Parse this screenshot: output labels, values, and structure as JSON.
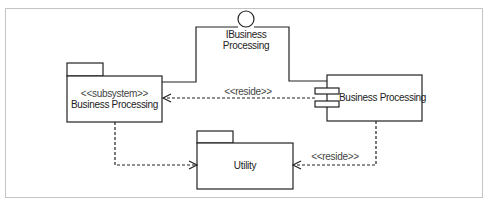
{
  "diagram": {
    "type": "UML component/subsystem diagram",
    "colors": {
      "line": "#222222",
      "frame": "#c4c4c4",
      "background": "#ffffff"
    },
    "interface": {
      "name_line1": "IBusiness",
      "name_line2": "Processing",
      "icon": "lollipop-interface-icon"
    },
    "subsystem": {
      "stereotype": "<<subsystem>>",
      "name": "Business Processing",
      "icon": "package-icon"
    },
    "component": {
      "name": "Business Processing",
      "icon": "component-icon"
    },
    "utility": {
      "name": "Utility",
      "icon": "package-icon"
    },
    "relations": [
      {
        "from": "component",
        "to": "subsystem",
        "label": "<<reside>>",
        "style": "dashed-open-arrow"
      },
      {
        "from": "subsystem",
        "to": "utility",
        "label": "",
        "style": "dashed-open-arrow"
      },
      {
        "from": "component",
        "to": "utility",
        "label": "<<reside>>",
        "style": "dashed-open-arrow"
      },
      {
        "from": "subsystem",
        "to": "interface",
        "label": "",
        "style": "solid-line"
      },
      {
        "from": "component",
        "to": "interface",
        "label": "",
        "style": "solid-line"
      }
    ]
  }
}
